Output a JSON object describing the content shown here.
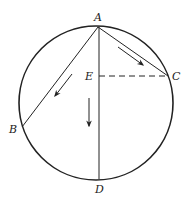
{
  "diagram": {
    "type": "geometry",
    "colors": {
      "stroke": "#222222",
      "background": "#ffffff"
    },
    "circle": {
      "cx": 96,
      "cy": 103,
      "r": 77
    },
    "points": {
      "A": {
        "label": "A",
        "x": 98,
        "y": 27
      },
      "B": {
        "label": "B",
        "x": 22,
        "y": 127
      },
      "C": {
        "label": "C",
        "x": 168,
        "y": 76
      },
      "D": {
        "label": "D",
        "x": 99,
        "y": 179
      },
      "E": {
        "label": "E",
        "x": 99,
        "y": 76
      }
    },
    "segments": [
      {
        "from": "A",
        "to": "B",
        "style": "solid"
      },
      {
        "from": "A",
        "to": "C",
        "style": "solid"
      },
      {
        "from": "A",
        "to": "D",
        "style": "solid"
      },
      {
        "from": "E",
        "to": "C",
        "style": "dashed"
      }
    ],
    "arrows": [
      {
        "along": "AC",
        "direction": "down-right"
      },
      {
        "along": "AB",
        "direction": "down-left"
      },
      {
        "along": "AD",
        "direction": "down"
      }
    ]
  }
}
